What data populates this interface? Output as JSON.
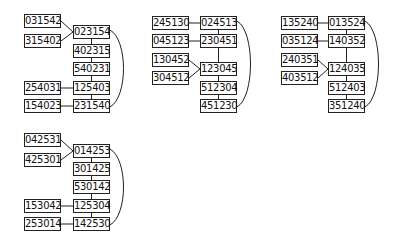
{
  "colors": {
    "line": "#222222",
    "box_border": "#222222",
    "text": "#111111",
    "background": "#ffffff"
  },
  "groups": [
    {
      "id": "g1",
      "nodes": [
        {
          "id": "a",
          "label": "031542",
          "x": 24,
          "y": 14
        },
        {
          "id": "b",
          "label": "023154",
          "x": 73,
          "y": 25
        },
        {
          "id": "c",
          "label": "315402",
          "x": 24,
          "y": 34
        },
        {
          "id": "d",
          "label": "402315",
          "x": 73,
          "y": 44
        },
        {
          "id": "e",
          "label": "540231",
          "x": 73,
          "y": 62
        },
        {
          "id": "f",
          "label": "254031",
          "x": 24,
          "y": 81
        },
        {
          "id": "g",
          "label": "125403",
          "x": 73,
          "y": 81
        },
        {
          "id": "h",
          "label": "154023",
          "x": 24,
          "y": 99
        },
        {
          "id": "i",
          "label": "231540",
          "x": 73,
          "y": 99
        }
      ],
      "edges": [
        [
          "a",
          "b"
        ],
        [
          "c",
          "b"
        ],
        [
          "b",
          "d"
        ],
        [
          "d",
          "e"
        ],
        [
          "e",
          "g"
        ],
        [
          "f",
          "g"
        ],
        [
          "g",
          "i"
        ],
        [
          "h",
          "i"
        ]
      ],
      "arc": [
        "b",
        "i"
      ]
    },
    {
      "id": "g2",
      "nodes": [
        {
          "id": "a",
          "label": "245130",
          "x": 152,
          "y": 16
        },
        {
          "id": "b",
          "label": "024513",
          "x": 200,
          "y": 16
        },
        {
          "id": "c",
          "label": "045123",
          "x": 152,
          "y": 34
        },
        {
          "id": "d",
          "label": "230451",
          "x": 200,
          "y": 34
        },
        {
          "id": "e",
          "label": "130452",
          "x": 152,
          "y": 53
        },
        {
          "id": "f",
          "label": "123045",
          "x": 200,
          "y": 62
        },
        {
          "id": "g",
          "label": "304512",
          "x": 152,
          "y": 71
        },
        {
          "id": "h",
          "label": "512304",
          "x": 200,
          "y": 81
        },
        {
          "id": "i",
          "label": "451230",
          "x": 200,
          "y": 99
        }
      ],
      "edges": [
        [
          "a",
          "b"
        ],
        [
          "c",
          "d"
        ],
        [
          "b",
          "d"
        ],
        [
          "d",
          "f"
        ],
        [
          "e",
          "f"
        ],
        [
          "g",
          "f"
        ],
        [
          "f",
          "h"
        ],
        [
          "h",
          "i"
        ]
      ],
      "arc": [
        "b",
        "i"
      ]
    },
    {
      "id": "g3",
      "nodes": [
        {
          "id": "a",
          "label": "135240",
          "x": 281,
          "y": 16
        },
        {
          "id": "b",
          "label": "013524",
          "x": 328,
          "y": 16
        },
        {
          "id": "c",
          "label": "035124",
          "x": 281,
          "y": 34
        },
        {
          "id": "d",
          "label": "140352",
          "x": 328,
          "y": 34
        },
        {
          "id": "e",
          "label": "240351",
          "x": 281,
          "y": 53
        },
        {
          "id": "f",
          "label": "124035",
          "x": 328,
          "y": 62
        },
        {
          "id": "g",
          "label": "403512",
          "x": 281,
          "y": 71
        },
        {
          "id": "h",
          "label": "512403",
          "x": 328,
          "y": 81
        },
        {
          "id": "i",
          "label": "351240",
          "x": 328,
          "y": 99
        }
      ],
      "edges": [
        [
          "a",
          "b"
        ],
        [
          "c",
          "d"
        ],
        [
          "b",
          "d"
        ],
        [
          "d",
          "f"
        ],
        [
          "e",
          "f"
        ],
        [
          "g",
          "f"
        ],
        [
          "f",
          "h"
        ],
        [
          "h",
          "i"
        ]
      ],
      "arc": [
        "b",
        "i"
      ]
    },
    {
      "id": "g4",
      "nodes": [
        {
          "id": "a",
          "label": "042531",
          "x": 24,
          "y": 133
        },
        {
          "id": "b",
          "label": "014253",
          "x": 73,
          "y": 144
        },
        {
          "id": "c",
          "label": "425301",
          "x": 24,
          "y": 153
        },
        {
          "id": "d",
          "label": "301425",
          "x": 73,
          "y": 162
        },
        {
          "id": "e",
          "label": "530142",
          "x": 73,
          "y": 180
        },
        {
          "id": "f",
          "label": "153042",
          "x": 24,
          "y": 199
        },
        {
          "id": "g",
          "label": "125304",
          "x": 73,
          "y": 199
        },
        {
          "id": "h",
          "label": "253014",
          "x": 24,
          "y": 217
        },
        {
          "id": "i",
          "label": "142530",
          "x": 73,
          "y": 217
        }
      ],
      "edges": [
        [
          "a",
          "b"
        ],
        [
          "c",
          "b"
        ],
        [
          "b",
          "d"
        ],
        [
          "d",
          "e"
        ],
        [
          "e",
          "g"
        ],
        [
          "f",
          "g"
        ],
        [
          "g",
          "i"
        ],
        [
          "h",
          "i"
        ]
      ],
      "arc": [
        "b",
        "i"
      ]
    }
  ]
}
